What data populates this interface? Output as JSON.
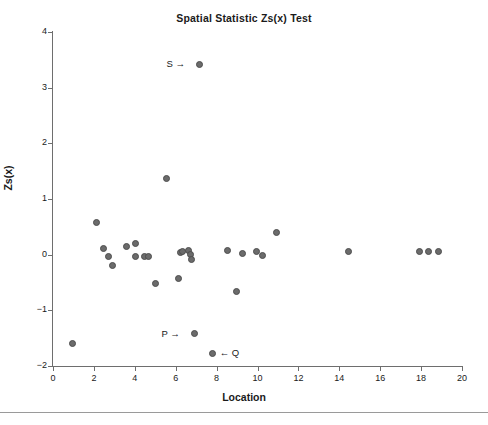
{
  "chart_data": {
    "type": "scatter",
    "title": "Spatial Statistic Zs(x) Test",
    "xlabel": "Location",
    "ylabel": "Zs(x)",
    "xlim": [
      0,
      20
    ],
    "ylim": [
      -2,
      4
    ],
    "xticks": [
      0,
      2,
      4,
      6,
      8,
      10,
      12,
      14,
      16,
      18,
      20
    ],
    "yticks": [
      -2,
      -1,
      0,
      1,
      2,
      3,
      4
    ],
    "grid": false,
    "legend": null,
    "marker_color": "#6b6b6b",
    "marker_edge_color": "#4d4d4d",
    "axis_color": "#6e6e6e",
    "points": [
      {
        "x": 0.93,
        "y": -1.6
      },
      {
        "x": 2.15,
        "y": 0.57
      },
      {
        "x": 2.49,
        "y": 0.11
      },
      {
        "x": 2.69,
        "y": -0.04
      },
      {
        "x": 2.93,
        "y": -0.19
      },
      {
        "x": 3.57,
        "y": 0.15
      },
      {
        "x": 4.01,
        "y": 0.2
      },
      {
        "x": 4.05,
        "y": -0.04
      },
      {
        "x": 4.45,
        "y": -0.03
      },
      {
        "x": 4.69,
        "y": -0.03
      },
      {
        "x": 5.02,
        "y": -0.52
      },
      {
        "x": 5.53,
        "y": 1.37
      },
      {
        "x": 6.16,
        "y": -0.42
      },
      {
        "x": 6.25,
        "y": 0.04
      },
      {
        "x": 6.35,
        "y": 0.06
      },
      {
        "x": 6.65,
        "y": 0.07
      },
      {
        "x": 6.7,
        "y": 0.01
      },
      {
        "x": 6.79,
        "y": -0.08
      },
      {
        "x": 7.18,
        "y": 3.42
      },
      {
        "x": 6.94,
        "y": -1.42
      },
      {
        "x": 7.82,
        "y": -1.77
      },
      {
        "x": 8.51,
        "y": 0.07
      },
      {
        "x": 8.99,
        "y": -0.66
      },
      {
        "x": 9.29,
        "y": 0.02
      },
      {
        "x": 9.96,
        "y": 0.06
      },
      {
        "x": 10.25,
        "y": -0.02
      },
      {
        "x": 10.95,
        "y": 0.39
      },
      {
        "x": 14.47,
        "y": 0.05
      },
      {
        "x": 17.94,
        "y": 0.06
      },
      {
        "x": 18.38,
        "y": 0.06
      },
      {
        "x": 18.87,
        "y": 0.06
      }
    ],
    "annotations": [
      {
        "text": "S →",
        "x": 6.45,
        "y": 3.42,
        "align": "right"
      },
      {
        "text": "P →",
        "x": 6.2,
        "y": -1.42,
        "align": "right"
      },
      {
        "text": "← Q",
        "x": 8.15,
        "y": -1.77,
        "align": "left"
      }
    ]
  }
}
